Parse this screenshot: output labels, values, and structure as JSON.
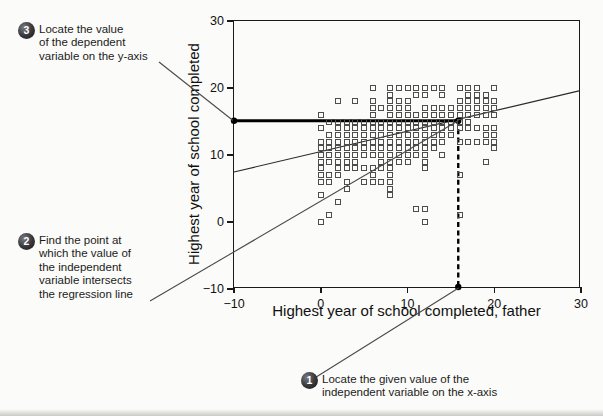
{
  "callouts": [
    {
      "number": "1",
      "lines": [
        "Locate the given value of the",
        "independent variable on the x-axis"
      ]
    },
    {
      "number": "2",
      "lines": [
        "Find the point at",
        "which the value of",
        "the independent",
        "variable intersects",
        "the regression line"
      ]
    },
    {
      "number": "3",
      "lines": [
        "Locate the value",
        "of the dependent",
        "variable on the y-axis"
      ]
    }
  ],
  "chart_data": {
    "type": "scatter",
    "title": "",
    "xlabel": "Highest year of school completed, father",
    "ylabel": "Highest year of school completed",
    "xlim": [
      -10,
      30
    ],
    "ylim": [
      -10,
      30
    ],
    "xticks": [
      -10,
      0,
      10,
      20,
      30
    ],
    "yticks": [
      30,
      20,
      10,
      0,
      -10
    ],
    "grid": false,
    "marker": "open-square",
    "points": [
      [
        0,
        16
      ],
      [
        0,
        14
      ],
      [
        0,
        12
      ],
      [
        0,
        11
      ],
      [
        0,
        10
      ],
      [
        0,
        9
      ],
      [
        0,
        8
      ],
      [
        0,
        7
      ],
      [
        0,
        6
      ],
      [
        0,
        4
      ],
      [
        0,
        0
      ],
      [
        1,
        15
      ],
      [
        1,
        13
      ],
      [
        1,
        12
      ],
      [
        1,
        11
      ],
      [
        1,
        10
      ],
      [
        1,
        9
      ],
      [
        1,
        7
      ],
      [
        1,
        6
      ],
      [
        1,
        1
      ],
      [
        2,
        18
      ],
      [
        2,
        15
      ],
      [
        2,
        14
      ],
      [
        2,
        13
      ],
      [
        2,
        12
      ],
      [
        2,
        11
      ],
      [
        2,
        10
      ],
      [
        2,
        9
      ],
      [
        2,
        8
      ],
      [
        2,
        7
      ],
      [
        2,
        3
      ],
      [
        3,
        15
      ],
      [
        3,
        14
      ],
      [
        3,
        13
      ],
      [
        3,
        12
      ],
      [
        3,
        11
      ],
      [
        3,
        10
      ],
      [
        3,
        9
      ],
      [
        3,
        8
      ],
      [
        3,
        6
      ],
      [
        3,
        5
      ],
      [
        4,
        18
      ],
      [
        4,
        15
      ],
      [
        4,
        14
      ],
      [
        4,
        13
      ],
      [
        4,
        12
      ],
      [
        4,
        11
      ],
      [
        4,
        10
      ],
      [
        4,
        9
      ],
      [
        4,
        8
      ],
      [
        5,
        15
      ],
      [
        5,
        14
      ],
      [
        5,
        13
      ],
      [
        5,
        12
      ],
      [
        5,
        11
      ],
      [
        5,
        10
      ],
      [
        5,
        8
      ],
      [
        5,
        6
      ],
      [
        6,
        20
      ],
      [
        6,
        18
      ],
      [
        6,
        17
      ],
      [
        6,
        16
      ],
      [
        6,
        15
      ],
      [
        6,
        14
      ],
      [
        6,
        13
      ],
      [
        6,
        12
      ],
      [
        6,
        11
      ],
      [
        6,
        10
      ],
      [
        6,
        8
      ],
      [
        6,
        7
      ],
      [
        6,
        6
      ],
      [
        7,
        17
      ],
      [
        7,
        15
      ],
      [
        7,
        14
      ],
      [
        7,
        13
      ],
      [
        7,
        12
      ],
      [
        7,
        11
      ],
      [
        7,
        10
      ],
      [
        7,
        9
      ],
      [
        7,
        8
      ],
      [
        7,
        6
      ],
      [
        8,
        20
      ],
      [
        8,
        19
      ],
      [
        8,
        18
      ],
      [
        8,
        17
      ],
      [
        8,
        16
      ],
      [
        8,
        15
      ],
      [
        8,
        14
      ],
      [
        8,
        13
      ],
      [
        8,
        12
      ],
      [
        8,
        11
      ],
      [
        8,
        10
      ],
      [
        8,
        9
      ],
      [
        8,
        8
      ],
      [
        8,
        7
      ],
      [
        8,
        6
      ],
      [
        8,
        5
      ],
      [
        8,
        4
      ],
      [
        9,
        20
      ],
      [
        9,
        18
      ],
      [
        9,
        17
      ],
      [
        9,
        16
      ],
      [
        9,
        15
      ],
      [
        9,
        14
      ],
      [
        9,
        13
      ],
      [
        9,
        12
      ],
      [
        9,
        11
      ],
      [
        9,
        10
      ],
      [
        9,
        9
      ],
      [
        10,
        20
      ],
      [
        10,
        18
      ],
      [
        10,
        17
      ],
      [
        10,
        16
      ],
      [
        10,
        15
      ],
      [
        10,
        14
      ],
      [
        10,
        13
      ],
      [
        10,
        12
      ],
      [
        10,
        11
      ],
      [
        10,
        10
      ],
      [
        10,
        9
      ],
      [
        11,
        20
      ],
      [
        11,
        19
      ],
      [
        11,
        16
      ],
      [
        11,
        15
      ],
      [
        11,
        14
      ],
      [
        11,
        13
      ],
      [
        11,
        12
      ],
      [
        11,
        11
      ],
      [
        11,
        10
      ],
      [
        11,
        2
      ],
      [
        12,
        20
      ],
      [
        12,
        19
      ],
      [
        12,
        17
      ],
      [
        12,
        16
      ],
      [
        12,
        15
      ],
      [
        12,
        14
      ],
      [
        12,
        13
      ],
      [
        12,
        12
      ],
      [
        12,
        11
      ],
      [
        12,
        10
      ],
      [
        12,
        9
      ],
      [
        12,
        8
      ],
      [
        12,
        2
      ],
      [
        12,
        0
      ],
      [
        13,
        20
      ],
      [
        13,
        17
      ],
      [
        13,
        16
      ],
      [
        13,
        15
      ],
      [
        13,
        14
      ],
      [
        13,
        13
      ],
      [
        13,
        12
      ],
      [
        13,
        11
      ],
      [
        14,
        20
      ],
      [
        14,
        19
      ],
      [
        14,
        17
      ],
      [
        14,
        16
      ],
      [
        14,
        15
      ],
      [
        14,
        14
      ],
      [
        14,
        13
      ],
      [
        14,
        12
      ],
      [
        14,
        10
      ],
      [
        15,
        17
      ],
      [
        15,
        16
      ],
      [
        15,
        15
      ],
      [
        15,
        14
      ],
      [
        15,
        13
      ],
      [
        16,
        20
      ],
      [
        16,
        18
      ],
      [
        16,
        17
      ],
      [
        16,
        16
      ],
      [
        16,
        15
      ],
      [
        16,
        14
      ],
      [
        16,
        12
      ],
      [
        16,
        7
      ],
      [
        16,
        1
      ],
      [
        17,
        20
      ],
      [
        17,
        19
      ],
      [
        17,
        18
      ],
      [
        17,
        17
      ],
      [
        17,
        16
      ],
      [
        17,
        15
      ],
      [
        17,
        14
      ],
      [
        17,
        12
      ],
      [
        18,
        20
      ],
      [
        18,
        19
      ],
      [
        18,
        18
      ],
      [
        18,
        17
      ],
      [
        18,
        16
      ],
      [
        18,
        14
      ],
      [
        18,
        12
      ],
      [
        19,
        19
      ],
      [
        19,
        18
      ],
      [
        19,
        17
      ],
      [
        19,
        16
      ],
      [
        19,
        14
      ],
      [
        19,
        13
      ],
      [
        19,
        12
      ],
      [
        19,
        9
      ],
      [
        20,
        20
      ],
      [
        20,
        18
      ],
      [
        20,
        17
      ],
      [
        20,
        16
      ],
      [
        20,
        14
      ],
      [
        20,
        13
      ],
      [
        20,
        12
      ],
      [
        20,
        11
      ]
    ],
    "regression_line": {
      "x1": -10,
      "y1": 7.3,
      "x2": 30,
      "y2": 19.5
    },
    "highlight": {
      "given_x_value": 16,
      "predicted_y_value": 15,
      "horizontal_line": {
        "from_x": -10,
        "to_x": 16,
        "y": 15
      },
      "vertical_dashed_line": {
        "x": 16,
        "from_y": 15,
        "to_y": -10
      }
    },
    "colors": {
      "marker_stroke": "#4d4d4d",
      "regression_line": "#2a2a2a",
      "highlight_line": "#000000",
      "leader_line": "#4a4a4a",
      "dot": "#000000"
    }
  }
}
